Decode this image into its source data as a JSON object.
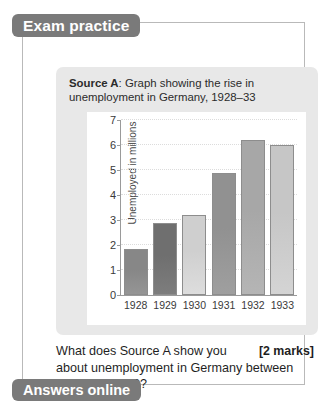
{
  "header": {
    "title": "Exam practice"
  },
  "footer": {
    "label": "Answers online"
  },
  "source": {
    "label": "Source A",
    "separator": ":",
    "caption": " Graph showing the rise in unemployment in Germany, 1928–33"
  },
  "question": {
    "text": "What does Source A show you about unemployment in Germany between 1928 and 1933?",
    "marks": "[2 marks]"
  },
  "colors": {
    "pill": "#7a7a7a",
    "source_bg": "#e8e8e8",
    "panel_bg": "#ffffff",
    "axis": "#9a9a9a",
    "grid": "#dcdcdc",
    "box_border": "#b9b9b9"
  },
  "chart_data": {
    "type": "bar",
    "title": "",
    "xlabel": "",
    "ylabel": "Unemployed in millions",
    "categories": [
      "1928",
      "1929",
      "1930",
      "1931",
      "1932",
      "1933"
    ],
    "values": [
      1.85,
      2.9,
      3.2,
      4.9,
      6.2,
      6.0
    ],
    "bar_colors": [
      "#878787",
      "#6f6f6f",
      "#cfcfcf",
      "#919191",
      "#a7a7a7",
      "#c6c6c6"
    ],
    "ylim": [
      0,
      7
    ],
    "yticks": [
      0,
      1,
      2,
      3,
      4,
      5,
      6,
      7
    ],
    "ytick_labels": [
      "0",
      "1",
      "2",
      "3",
      "4",
      "5",
      "6",
      "7"
    ],
    "grid": true,
    "legend": "none"
  }
}
